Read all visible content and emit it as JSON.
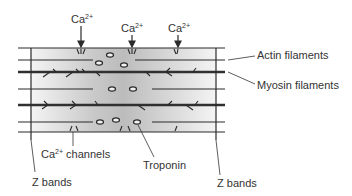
{
  "labels": {
    "ca_top_1": {
      "base": "Ca",
      "sup": "2+"
    },
    "ca_top_2": {
      "base": "Ca",
      "sup": "2+"
    },
    "ca_top_3": {
      "base": "Ca",
      "sup": "2+"
    },
    "actin": "Actin filaments",
    "myosin": "Myosin filaments",
    "ca_channels": {
      "base": "Ca",
      "sup": "2+",
      "rest": " channels"
    },
    "troponin": "Troponin",
    "z_bands_left": "Z bands",
    "z_bands_right": "Z bands"
  },
  "colors": {
    "line": "#2a2a2a",
    "thick_line": "#303030",
    "gradient_dark": "#bdbdbd",
    "gradient_light": "#f2f2f2",
    "text": "#333333"
  }
}
